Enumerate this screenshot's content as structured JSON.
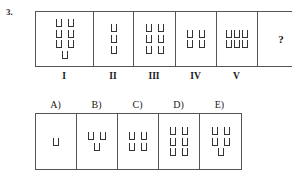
{
  "question": {
    "number": "3."
  },
  "symbol": {
    "name": "u-shape-glyph",
    "char": "⊔",
    "stroke_color": "#333333"
  },
  "colors": {
    "border": "#555555",
    "text": "#1a1a1a",
    "background": "#ffffff"
  },
  "sequence": {
    "cells": [
      {
        "label": "I",
        "count": 7,
        "rows": [
          2,
          2,
          2,
          1
        ],
        "dense": false,
        "content_type": "glyphs",
        "width": 58
      },
      {
        "label": "II",
        "count": 3,
        "rows": [
          1,
          1,
          1
        ],
        "dense": false,
        "content_type": "glyphs",
        "width": 40
      },
      {
        "label": "III",
        "count": 6,
        "rows": [
          2,
          2,
          2
        ],
        "dense": false,
        "content_type": "glyphs",
        "width": 42
      },
      {
        "label": "IV",
        "count": 4,
        "rows": [
          2,
          2
        ],
        "dense": false,
        "content_type": "glyphs",
        "width": 41
      },
      {
        "label": "V",
        "count": 6,
        "rows": [
          3,
          3
        ],
        "dense": true,
        "content_type": "glyphs",
        "width": 41
      },
      {
        "label": "",
        "count": 0,
        "rows": [],
        "dense": false,
        "content_type": "question-mark",
        "question_mark": "?",
        "width": 46
      }
    ]
  },
  "options": {
    "cells": [
      {
        "label": "A)",
        "count": 1,
        "rows": [
          1
        ],
        "dense": false,
        "content_type": "glyphs",
        "width": 41
      },
      {
        "label": "B)",
        "count": 3,
        "rows": [
          2,
          1
        ],
        "dense": false,
        "content_type": "glyphs",
        "width": 41
      },
      {
        "label": "C)",
        "count": 4,
        "rows": [
          2,
          2
        ],
        "dense": false,
        "content_type": "glyphs",
        "width": 41
      },
      {
        "label": "D)",
        "count": 6,
        "rows": [
          2,
          2,
          2
        ],
        "dense": false,
        "content_type": "glyphs",
        "width": 41
      },
      {
        "label": "E)",
        "count": 5,
        "rows": [
          2,
          2,
          1
        ],
        "dense": false,
        "content_type": "glyphs",
        "width": 41
      }
    ]
  }
}
